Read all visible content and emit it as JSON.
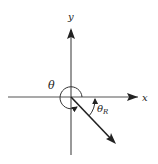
{
  "diagram": {
    "type": "reference-angle",
    "axes": {
      "x_label": "x",
      "y_label": "y"
    },
    "angle_label": "θ",
    "reference_angle_label": {
      "base": "θ",
      "subscript": "R"
    },
    "colors": {
      "stroke": "#222222",
      "axis": "#555555",
      "background": "#ffffff"
    }
  }
}
